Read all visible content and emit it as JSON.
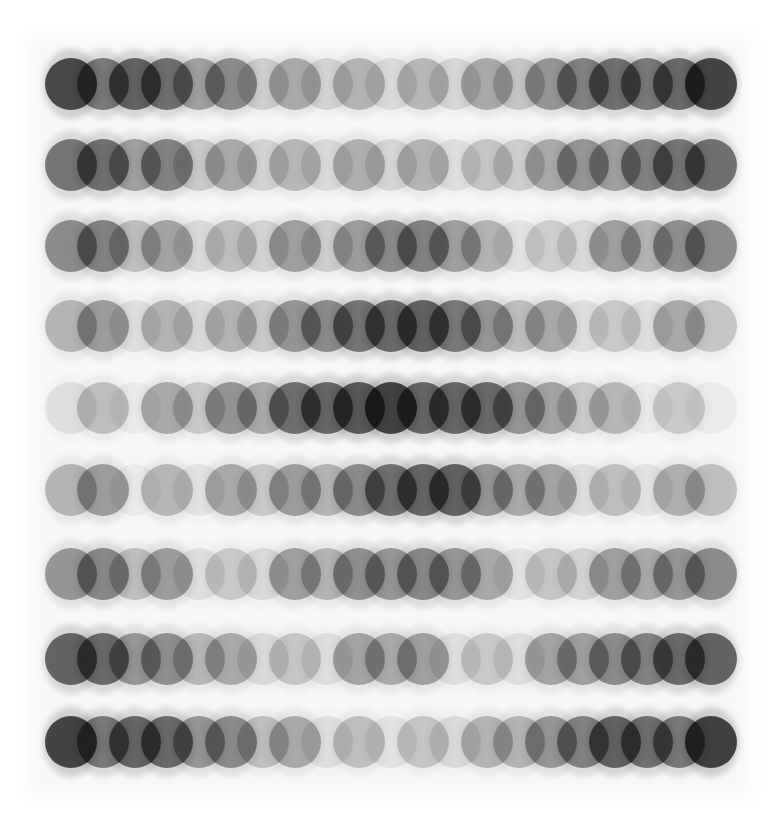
{
  "artwork": {
    "title": "",
    "background": "#ffffff",
    "dot_color": "#000000",
    "grid": {
      "rows": 9,
      "cols": 21,
      "diameter": 52,
      "x_start": 71,
      "x_pitch": 32,
      "row_centers": [
        84,
        165,
        246,
        326,
        408,
        490,
        574,
        659,
        742
      ]
    },
    "opacity": [
      [
        0.88,
        0.6,
        0.72,
        0.65,
        0.4,
        0.5,
        0.18,
        0.35,
        0.15,
        0.3,
        0.12,
        0.28,
        0.14,
        0.35,
        0.22,
        0.45,
        0.55,
        0.65,
        0.6,
        0.68,
        0.9
      ],
      [
        0.62,
        0.65,
        0.4,
        0.55,
        0.2,
        0.35,
        0.15,
        0.28,
        0.12,
        0.32,
        0.14,
        0.3,
        0.1,
        0.22,
        0.18,
        0.35,
        0.45,
        0.4,
        0.55,
        0.62,
        0.65
      ],
      [
        0.5,
        0.55,
        0.25,
        0.38,
        0.12,
        0.25,
        0.15,
        0.4,
        0.18,
        0.42,
        0.5,
        0.55,
        0.4,
        0.3,
        0.08,
        0.18,
        0.12,
        0.4,
        0.3,
        0.48,
        0.5
      ],
      [
        0.3,
        0.42,
        0.1,
        0.3,
        0.12,
        0.3,
        0.2,
        0.45,
        0.5,
        0.62,
        0.68,
        0.72,
        0.6,
        0.45,
        0.25,
        0.35,
        0.1,
        0.2,
        0.1,
        0.35,
        0.22
      ],
      [
        0.1,
        0.25,
        0.05,
        0.35,
        0.2,
        0.45,
        0.35,
        0.65,
        0.7,
        0.78,
        0.9,
        0.7,
        0.7,
        0.68,
        0.45,
        0.38,
        0.2,
        0.28,
        0.05,
        0.2,
        0.05
      ],
      [
        0.3,
        0.42,
        0.05,
        0.28,
        0.08,
        0.35,
        0.2,
        0.42,
        0.3,
        0.5,
        0.65,
        0.7,
        0.72,
        0.45,
        0.35,
        0.38,
        0.1,
        0.25,
        0.08,
        0.32,
        0.25
      ],
      [
        0.45,
        0.52,
        0.25,
        0.42,
        0.1,
        0.2,
        0.12,
        0.4,
        0.3,
        0.48,
        0.45,
        0.52,
        0.45,
        0.35,
        0.08,
        0.22,
        0.15,
        0.4,
        0.35,
        0.45,
        0.5
      ],
      [
        0.72,
        0.68,
        0.45,
        0.48,
        0.28,
        0.35,
        0.12,
        0.22,
        0.1,
        0.38,
        0.35,
        0.4,
        0.1,
        0.2,
        0.1,
        0.38,
        0.4,
        0.5,
        0.55,
        0.68,
        0.72
      ],
      [
        0.9,
        0.6,
        0.7,
        0.68,
        0.45,
        0.5,
        0.25,
        0.35,
        0.1,
        0.25,
        0.08,
        0.22,
        0.12,
        0.3,
        0.3,
        0.45,
        0.55,
        0.72,
        0.65,
        0.6,
        0.92
      ]
    ]
  }
}
